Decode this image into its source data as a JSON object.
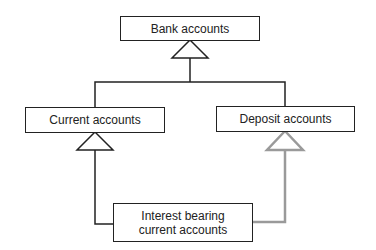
{
  "diagram": {
    "type": "uml-class-inheritance",
    "nodes": [
      {
        "id": "bank",
        "label": "Bank accounts"
      },
      {
        "id": "current",
        "label": "Current accounts"
      },
      {
        "id": "deposit",
        "label": "Deposit accounts"
      },
      {
        "id": "interest",
        "label": "Interest bearing current accounts"
      }
    ],
    "edges": [
      {
        "from": "current",
        "to": "bank",
        "type": "generalization"
      },
      {
        "from": "deposit",
        "to": "bank",
        "type": "generalization"
      },
      {
        "from": "interest",
        "to": "current",
        "type": "generalization"
      },
      {
        "from": "interest",
        "to": "deposit",
        "type": "generalization",
        "color": "#9a9a9a"
      }
    ],
    "colors": {
      "line": "#222222",
      "highlight": "#9a9a9a"
    }
  },
  "labels": {
    "bank": "Bank accounts",
    "current": "Current accounts",
    "deposit": "Deposit accounts",
    "interest_line1": "Interest bearing",
    "interest_line2": "current accounts"
  }
}
